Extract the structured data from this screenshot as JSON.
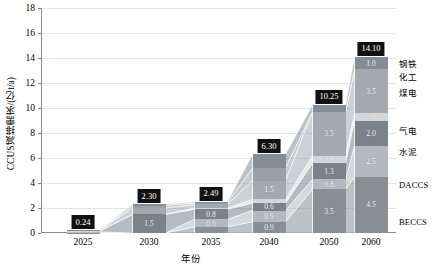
{
  "chart_data": {
    "type": "bar",
    "subtype": "stacked-bar-with-connecting-bands",
    "title": "",
    "xlabel": "年份",
    "ylabel": "CCUS减排需求/(亿t/a)",
    "ylim": [
      0,
      18
    ],
    "yticks": [
      0,
      2,
      4,
      6,
      8,
      10,
      12,
      14,
      16,
      18
    ],
    "grid": true,
    "legend_position": "right",
    "categories": [
      "2025",
      "2030",
      "2035",
      "2040",
      "2050",
      "2060"
    ],
    "totals": [
      "0.24",
      "2.30",
      "2.49",
      "6.30",
      "10.25",
      "14.10"
    ],
    "total_values": [
      0.24,
      2.3,
      2.49,
      6.3,
      10.25,
      14.1
    ],
    "series": [
      {
        "name": "BECCS",
        "color": "#8a8f96",
        "values": [
          0.04,
          0.0,
          0.5,
          0.9,
          3.5,
          4.5
        ],
        "labels": [
          "",
          "",
          "0.5",
          "0.9",
          "3.5",
          "4.5"
        ]
      },
      {
        "name": "DACCS",
        "color": "#b5b9bf",
        "values": [
          0.05,
          0.0,
          0.6,
          0.9,
          0.8,
          2.5
        ],
        "labels": [
          "",
          "",
          "0.6",
          "0.9",
          "0.8",
          "2.5"
        ]
      },
      {
        "name": "水泥",
        "color": "#7c8289",
        "values": [
          0.05,
          1.5,
          0.8,
          0.6,
          1.3,
          2.0
        ],
        "labels": [
          "",
          "1.5",
          "0.8",
          "0.6",
          "1.3",
          "2.0"
        ]
      },
      {
        "name": "气电",
        "color": "#d3d6da",
        "values": [
          0.03,
          0.0,
          0.1,
          0.3,
          0.6,
          0.6
        ],
        "labels": [
          "",
          "",
          "",
          "",
          "0.6",
          "0.6"
        ]
      },
      {
        "name": "煤电",
        "color": "#a4a9b0",
        "values": [
          0.04,
          0.5,
          0.3,
          1.5,
          3.5,
          3.5
        ],
        "labels": [
          "",
          "0.5",
          "",
          "1.5",
          "3.5",
          "3.5"
        ]
      },
      {
        "name": "化工",
        "color": "#9aa0a7",
        "values": [
          0.02,
          0.2,
          0.12,
          1.0,
          0.0,
          0.0
        ],
        "labels": [
          "",
          "",
          "",
          "",
          "",
          ""
        ]
      },
      {
        "name": "钢铁",
        "color": "#868c93",
        "values": [
          0.01,
          0.1,
          0.07,
          1.1,
          0.55,
          1.0
        ],
        "labels": [
          "",
          "",
          "",
          "",
          "0.6",
          "1.0"
        ]
      }
    ],
    "legend": [
      {
        "label": "钢铁",
        "script": "cjk"
      },
      {
        "label": "化工",
        "script": "cjk"
      },
      {
        "label": "煤电",
        "script": "cjk"
      },
      {
        "label": "气电",
        "script": "cjk"
      },
      {
        "label": "水泥",
        "script": "cjk"
      },
      {
        "label": "DACCS",
        "script": "latin"
      },
      {
        "label": "BECCS",
        "script": "latin"
      }
    ]
  },
  "axis": {
    "y_title": "CCUS减排需求/(亿t/a)",
    "x_title": "年份",
    "y_tick_labels": [
      "0",
      "2",
      "4",
      "6",
      "8",
      "10",
      "12",
      "14",
      "16",
      "18"
    ],
    "x_tick_labels": [
      "2025",
      "2030",
      "2035",
      "2040",
      "2050",
      "2060"
    ]
  },
  "bars": [
    {
      "year": "2025",
      "total": "0.24",
      "segments": [
        {
          "name": "BECCS",
          "value": 0.04,
          "label": ""
        },
        {
          "name": "DACCS",
          "value": 0.05,
          "label": ""
        },
        {
          "name": "水泥",
          "value": 0.05,
          "label": ""
        },
        {
          "name": "气电",
          "value": 0.03,
          "label": ""
        },
        {
          "name": "煤电",
          "value": 0.04,
          "label": ""
        },
        {
          "name": "化工",
          "value": 0.02,
          "label": ""
        },
        {
          "name": "钢铁",
          "value": 0.01,
          "label": ""
        }
      ]
    },
    {
      "year": "2030",
      "total": "2.30",
      "segments": [
        {
          "name": "BECCS",
          "value": 0.0,
          "label": ""
        },
        {
          "name": "DACCS",
          "value": 0.0,
          "label": ""
        },
        {
          "name": "水泥",
          "value": 1.5,
          "label": "1.5"
        },
        {
          "name": "气电",
          "value": 0.0,
          "label": ""
        },
        {
          "name": "煤电",
          "value": 0.5,
          "label": "0.5"
        },
        {
          "name": "化工",
          "value": 0.2,
          "label": ""
        },
        {
          "name": "钢铁",
          "value": 0.1,
          "label": ""
        }
      ]
    },
    {
      "year": "2035",
      "total": "2.49",
      "segments": [
        {
          "name": "BECCS",
          "value": 0.5,
          "label": "0.5"
        },
        {
          "name": "DACCS",
          "value": 0.6,
          "label": "0.6"
        },
        {
          "name": "水泥",
          "value": 0.8,
          "label": "0.8"
        },
        {
          "name": "气电",
          "value": 0.1,
          "label": ""
        },
        {
          "name": "煤电",
          "value": 0.3,
          "label": ""
        },
        {
          "name": "化工",
          "value": 0.12,
          "label": ""
        },
        {
          "name": "钢铁",
          "value": 0.07,
          "label": ""
        }
      ]
    },
    {
      "year": "2040",
      "total": "6.30",
      "segments": [
        {
          "name": "BECCS",
          "value": 0.9,
          "label": "0.9"
        },
        {
          "name": "DACCS",
          "value": 0.9,
          "label": "0.9"
        },
        {
          "name": "水泥",
          "value": 0.6,
          "label": "0.6"
        },
        {
          "name": "气电",
          "value": 0.3,
          "label": ""
        },
        {
          "name": "煤电",
          "value": 1.5,
          "label": "1.5"
        },
        {
          "name": "化工",
          "value": 1.0,
          "label": ""
        },
        {
          "name": "钢铁",
          "value": 1.1,
          "label": ""
        }
      ]
    },
    {
      "year": "2050",
      "total": "10.25",
      "segments": [
        {
          "name": "BECCS",
          "value": 3.5,
          "label": "3.5"
        },
        {
          "name": "DACCS",
          "value": 0.8,
          "label": "0.8"
        },
        {
          "name": "水泥",
          "value": 1.3,
          "label": "1.3"
        },
        {
          "name": "气电",
          "value": 0.6,
          "label": "0.6"
        },
        {
          "name": "煤电",
          "value": 3.5,
          "label": "3.5"
        },
        {
          "name": "化工",
          "value": 0.0,
          "label": ""
        },
        {
          "name": "钢铁",
          "value": 0.55,
          "label": "0.6"
        }
      ]
    },
    {
      "year": "2060",
      "total": "14.10",
      "segments": [
        {
          "name": "BECCS",
          "value": 4.5,
          "label": "4.5"
        },
        {
          "name": "DACCS",
          "value": 2.5,
          "label": "2.5"
        },
        {
          "name": "水泥",
          "value": 2.0,
          "label": "2.0"
        },
        {
          "name": "气电",
          "value": 0.6,
          "label": "0.6"
        },
        {
          "name": "煤电",
          "value": 3.5,
          "label": "3.5"
        },
        {
          "name": "化工",
          "value": 0.0,
          "label": ""
        },
        {
          "name": "钢铁",
          "value": 1.0,
          "label": "1.0"
        }
      ]
    }
  ],
  "colors": {
    "beccs": "#8a8f96",
    "daccs": "#b5b9bf",
    "cement": "#7c8289",
    "gas_power": "#d3d6da",
    "coal_power": "#a4a9b0",
    "chemicals": "#9aa0a7",
    "steel": "#868c93",
    "grid": "#e3e3e3",
    "axis": "#8a8a8a",
    "chip_bg": "#111111",
    "chip_text": "#ffffff",
    "background": "#ffffff"
  }
}
